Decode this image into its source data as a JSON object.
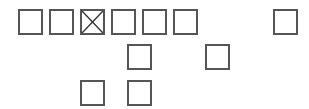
{
  "boxes": [
    {
      "id": "b0",
      "row": 1,
      "checked": false
    },
    {
      "id": "b1",
      "row": 1,
      "checked": false
    },
    {
      "id": "b2",
      "row": 1,
      "checked": true,
      "mark": "x-cross"
    },
    {
      "id": "b3",
      "row": 1,
      "checked": false
    },
    {
      "id": "b4",
      "row": 1,
      "checked": false
    },
    {
      "id": "b5",
      "row": 1,
      "checked": false
    },
    {
      "id": "b6",
      "row": 1,
      "checked": false
    },
    {
      "id": "b7",
      "row": 2,
      "checked": false
    },
    {
      "id": "b8",
      "row": 2,
      "checked": false
    },
    {
      "id": "b9",
      "row": 3,
      "checked": false
    },
    {
      "id": "b10",
      "row": 3,
      "checked": false
    }
  ],
  "colors": {
    "border": "#555555",
    "mark": "#333333",
    "background": "#ffffff"
  }
}
